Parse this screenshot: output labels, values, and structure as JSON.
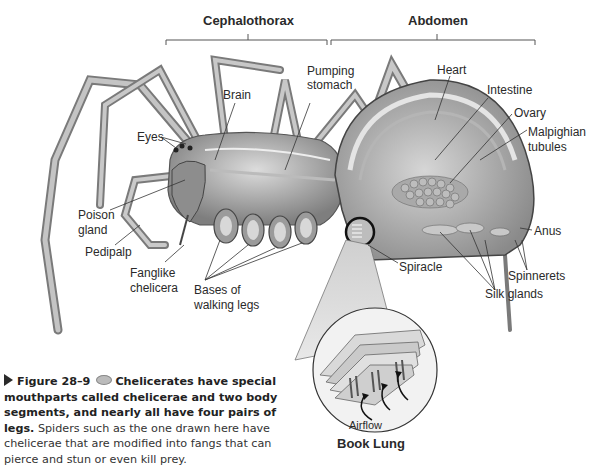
{
  "figure": {
    "sections": {
      "cephalothorax": "Cephalothorax",
      "abdomen": "Abdomen"
    },
    "labels": {
      "eyes": "Eyes",
      "brain": "Brain",
      "pumping_stomach_1": "Pumping",
      "pumping_stomach_2": "stomach",
      "heart": "Heart",
      "intestine": "Intestine",
      "ovary": "Ovary",
      "malpighian_1": "Malpighian",
      "malpighian_2": "tubules",
      "poison_gland_1": "Poison",
      "poison_gland_2": "gland",
      "pedipalp": "Pedipalp",
      "fanglike_1": "Fanglike",
      "fanglike_2": "chelicera",
      "bases_1": "Bases of",
      "bases_2": "walking legs",
      "spiracle": "Spiracle",
      "anus": "Anus",
      "spinnerets": "Spinnerets",
      "silk_glands": "Silk glands",
      "airflow": "Airflow",
      "book_lung": "Book Lung"
    },
    "caption": {
      "figure_number": "Figure 28–9",
      "bold_text": "Chelicerates have special mouthparts called chelicerae and two body segments, and nearly all have four pairs of legs.",
      "body_text": "Spiders such as the one drawn here have chelicerae that are modified into fangs that can pierce and stun or even kill prey.",
      "icon": "eye-icon"
    },
    "colors": {
      "label_text": "#2a2a2a",
      "line": "#444444",
      "body_fill": "#9a9a9a",
      "body_light": "#cfcfcf"
    }
  }
}
